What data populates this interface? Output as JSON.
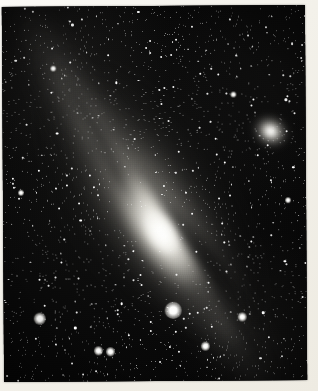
{
  "image": {
    "subject": "Andromeda Galaxy",
    "catalog_designation": "M31",
    "medium": "black-and-white photographic print",
    "orientation": "portrait",
    "width_px": 318,
    "height_px": 391,
    "border": {
      "style": "white photographic print margin",
      "color": "#f4f2ea",
      "top_px": 6,
      "left_px": 3,
      "right_px": 12,
      "bottom_px": 10
    },
    "palette": {
      "sky": "#070707",
      "star": "#ffffff",
      "galaxy_core": "#fffffc",
      "galaxy_halo": "#8e8c85",
      "dust_lane": "#060606",
      "paper": "#f4f2ea"
    }
  },
  "objects": {
    "primary_galaxy": {
      "name": "Andromeda Galaxy",
      "designation": "M31",
      "type": "spiral-galaxy",
      "center_x": 161,
      "center_y": 229,
      "position_angle_deg": 57,
      "description": "Large inclined spiral galaxy with bright elongated nucleus, broad luminous disk and dark dust lanes on the south-east flank."
    },
    "companion_galaxy": {
      "name": "Companion elliptical galaxy",
      "designation": "M32",
      "type": "elliptical-galaxy",
      "center_x": 272,
      "center_y": 130,
      "description": "Small bright compact elliptical companion above and right of the main galaxy."
    },
    "foreground_stars": [
      {
        "label": "bright-star-lower-centre",
        "x": 176,
        "y": 314,
        "magnitude_rank": 1
      },
      {
        "label": "bright-star-left",
        "x": 43,
        "y": 322,
        "magnitude_rank": 2
      },
      {
        "label": "star-lower-left-a",
        "x": 101,
        "y": 354,
        "magnitude_rank": 3
      },
      {
        "label": "star-lower-left-b",
        "x": 113,
        "y": 355,
        "magnitude_rank": 3
      },
      {
        "label": "star-lower-centre",
        "x": 208,
        "y": 350,
        "magnitude_rank": 3
      },
      {
        "label": "knot-lower-right",
        "x": 245,
        "y": 321,
        "magnitude_rank": 3
      },
      {
        "label": "star-upper-right",
        "x": 238,
        "y": 99,
        "magnitude_rank": 4
      },
      {
        "label": "star-mid-right",
        "x": 292,
        "y": 205,
        "magnitude_rank": 4
      },
      {
        "label": "star-upper-left",
        "x": 58,
        "y": 72,
        "magnitude_rank": 4
      },
      {
        "label": "star-mid-left",
        "x": 25,
        "y": 196,
        "magnitude_rank": 4
      }
    ],
    "dust_lanes": [
      {
        "label": "main-south-east-lane",
        "x": 196,
        "y": 246,
        "angle_deg": 57
      },
      {
        "label": "outer-south-east-lane",
        "x": 218,
        "y": 265,
        "angle_deg": 56
      },
      {
        "label": "north-west-lane",
        "x": 128,
        "y": 188,
        "angle_deg": 58
      },
      {
        "label": "upper-arm-lane",
        "x": 96,
        "y": 126,
        "angle_deg": 59
      },
      {
        "label": "south-west-lane",
        "x": 244,
        "y": 330,
        "angle_deg": 55
      }
    ],
    "starfield": {
      "description": "Dense field of several thousand faint field stars filling the frame",
      "approximate_count": 2400
    }
  }
}
